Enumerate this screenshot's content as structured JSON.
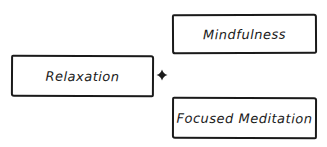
{
  "diagram": {
    "style": "hand-drawn",
    "nodes": [
      {
        "id": "relaxation",
        "label": "Relaxation"
      },
      {
        "id": "mindfulness",
        "label": "Mindfulness"
      },
      {
        "id": "focused-meditation",
        "label": "Focused Meditation"
      }
    ],
    "connector": {
      "type": "plus-junction",
      "from": "relaxation",
      "to": [
        "mindfulness",
        "focused-meditation"
      ]
    },
    "colors": {
      "stroke": "#1a1a1a",
      "background": "#ffffff"
    }
  }
}
